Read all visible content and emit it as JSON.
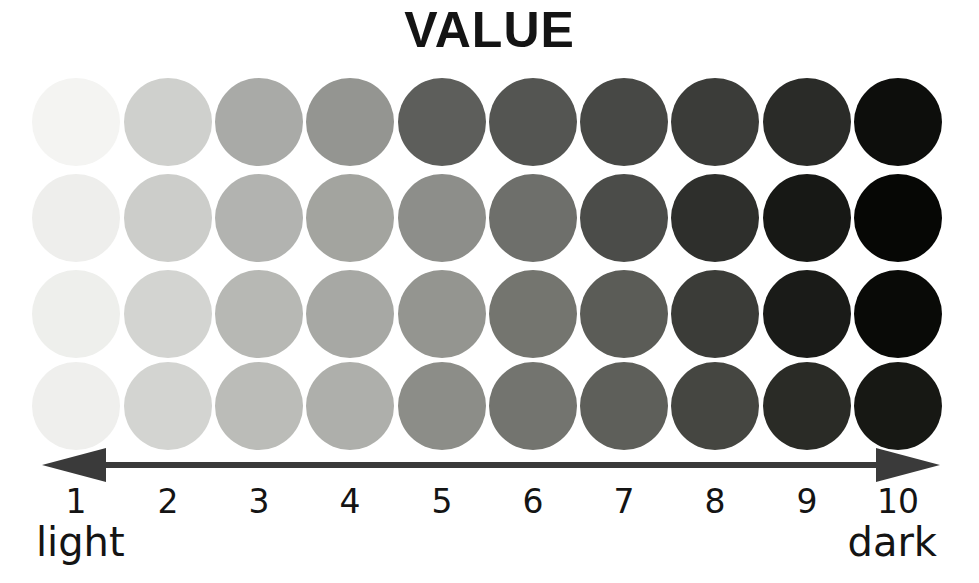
{
  "title": "VALUE",
  "axis": {
    "left_arrow_icon": "arrow-left-icon",
    "right_arrow_icon": "arrow-right-icon",
    "line_color": "#3a3a3a",
    "start_label": "light",
    "end_label": "dark",
    "ticks": [
      "1",
      "2",
      "3",
      "4",
      "5",
      "6",
      "7",
      "8",
      "9",
      "10"
    ]
  },
  "chart_data": {
    "type": "heatmap",
    "title": "VALUE",
    "xlabel": "",
    "ylabel": "",
    "categories": [
      "1",
      "2",
      "3",
      "4",
      "5",
      "6",
      "7",
      "8",
      "9",
      "10"
    ],
    "axis_start_label": "light",
    "axis_end_label": "dark",
    "grid": false,
    "legend": "none",
    "rows": [
      {
        "name": "row-1",
        "values": [
          1,
          2,
          3,
          4,
          5,
          6,
          7,
          8,
          9,
          10
        ],
        "colors": [
          "#f4f4f2",
          "#cfd0cd",
          "#a9aaa7",
          "#949591",
          "#5d5e5b",
          "#545552",
          "#474845",
          "#3b3c39",
          "#2a2b28",
          "#0d0e0c"
        ]
      },
      {
        "name": "row-2",
        "values": [
          1,
          2,
          3,
          4,
          5,
          6,
          7,
          8,
          9,
          10
        ],
        "colors": [
          "#eeeeec",
          "#cccdca",
          "#b2b3b0",
          "#a3a49f",
          "#8d8e8a",
          "#6e6f6b",
          "#4b4c49",
          "#2e2f2c",
          "#171815",
          "#060705"
        ]
      },
      {
        "name": "row-3",
        "values": [
          1,
          2,
          3,
          4,
          5,
          6,
          7,
          8,
          9,
          10
        ],
        "colors": [
          "#eeefec",
          "#d3d4d1",
          "#b7b8b4",
          "#a7a8a4",
          "#949590",
          "#74756f",
          "#5b5c57",
          "#3b3c38",
          "#1a1b18",
          "#090a07"
        ]
      },
      {
        "name": "row-4",
        "values": [
          1,
          2,
          3,
          4,
          5,
          6,
          7,
          8,
          9,
          10
        ],
        "colors": [
          "#efefed",
          "#d3d4d1",
          "#bbbcb8",
          "#aeafab",
          "#8c8d88",
          "#73746f",
          "#5e5f5a",
          "#454641",
          "#2a2b26",
          "#171814"
        ]
      }
    ],
    "row_tops": [
      78,
      174,
      270,
      362
    ],
    "column_centers": [
      76,
      168,
      259,
      350,
      442,
      533,
      624,
      715,
      807,
      898
    ],
    "swatch_diameter": 88
  }
}
